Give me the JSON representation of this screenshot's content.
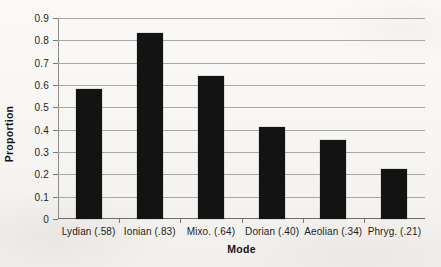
{
  "chart_data": {
    "type": "bar",
    "title": "",
    "xlabel": "Mode",
    "ylabel": "Proportion",
    "categories": [
      "Lydian (.58)",
      "Ionian (.83)",
      "Mixo. (.64)",
      "Dorian (.40)",
      "Aeolian (.34)",
      "Phryg. (.21)"
    ],
    "values": [
      0.58,
      0.835,
      0.64,
      0.41,
      0.355,
      0.225
    ],
    "ylim": [
      0,
      0.9
    ],
    "ytick_labels": [
      "0.9",
      "0.8",
      "0.7",
      "0.6",
      "0.5",
      "0.4",
      "0.3",
      "0.2",
      "0.1",
      "0"
    ],
    "ytick_values": [
      0.9,
      0.8,
      0.7,
      0.6,
      0.5,
      0.4,
      0.3,
      0.2,
      0.1,
      0
    ],
    "grid": true,
    "legend": "none",
    "bar_color": "#131313",
    "gridline_color": "#a9a7a4",
    "background_color": "#f7f6f4"
  }
}
